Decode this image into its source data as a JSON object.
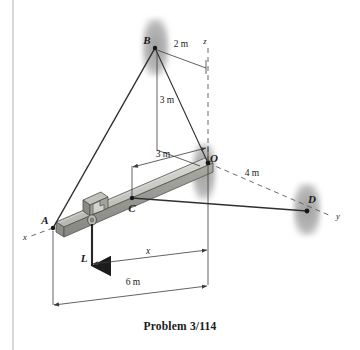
{
  "figure": {
    "caption": "Problem 3/114",
    "points": {
      "A": "A",
      "B": "B",
      "C": "C",
      "D": "D",
      "O": "O"
    },
    "axes": {
      "x": "x",
      "y": "y",
      "z": "z"
    },
    "dimensions": {
      "b_to_z": "2 m",
      "b_vertical": "3 m",
      "o_to_c": "3 m",
      "o_to_d": "4 m",
      "trolley_x": "x",
      "beam_length": "6 m"
    },
    "load": {
      "label": "L"
    },
    "colors": {
      "line": "#3a3a3a",
      "beam_top": "#c9c9c4",
      "beam_front": "#9d9d98",
      "beam_side": "#7e7e7a",
      "wall_patch": "#a9a9a9",
      "text": "#1a1a1a",
      "border": "#b8b8b8"
    }
  }
}
